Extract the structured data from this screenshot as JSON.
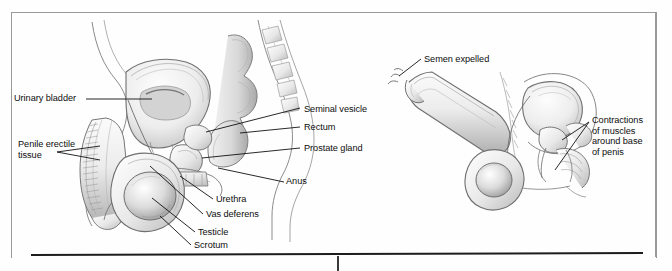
{
  "page": {
    "background_color": "#fefefe",
    "frame_color": "#9a9a9a",
    "rule_color": "#1d1d1d",
    "text_color": "#0d0d0d",
    "art_style": "grayscale pencil medical illustration"
  },
  "figures": [
    {
      "id": "male-reproductive-anatomy-sagittal",
      "name": "Male reproductive system, sagittal section",
      "labels": [
        {
          "id": "urinary-bladder",
          "text": "Urinary bladder",
          "x": 14,
          "y": 93,
          "align": "left"
        },
        {
          "id": "penile-erectile-tissue",
          "text": "Penile erectile\ntissue",
          "x": 18,
          "y": 139,
          "align": "left"
        },
        {
          "id": "seminal-vesicle",
          "text": "Seminal vesicle",
          "x": 304,
          "y": 104,
          "align": "left"
        },
        {
          "id": "rectum",
          "text": "Rectum",
          "x": 304,
          "y": 122,
          "align": "left"
        },
        {
          "id": "prostate-gland",
          "text": "Prostate gland",
          "x": 304,
          "y": 143,
          "align": "left"
        },
        {
          "id": "anus",
          "text": "Anus",
          "x": 286,
          "y": 180,
          "align": "left"
        },
        {
          "id": "urethra",
          "text": "Urethra",
          "x": 216,
          "y": 196,
          "align": "left"
        },
        {
          "id": "vas-deferens",
          "text": "Vas deferens",
          "x": 206,
          "y": 211,
          "align": "left"
        },
        {
          "id": "testicle",
          "text": "Testicle",
          "x": 198,
          "y": 230,
          "align": "left"
        },
        {
          "id": "scrotum",
          "text": "Scrotum",
          "x": 194,
          "y": 243,
          "align": "left"
        }
      ]
    },
    {
      "id": "ejaculation-diagram",
      "name": "Ejaculation, semen expelled",
      "labels": [
        {
          "id": "semen-expelled",
          "text": "Semen expelled",
          "x": 424,
          "y": 56,
          "align": "left"
        },
        {
          "id": "contractions-of-muscles",
          "text": "Contractions\nof muscles\naround base\nof penis",
          "x": 592,
          "y": 117,
          "align": "left"
        }
      ]
    }
  ]
}
